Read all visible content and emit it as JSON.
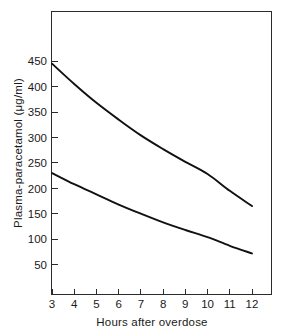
{
  "figure": {
    "background_color": "#ffffff",
    "line_color": "#111111",
    "axis_color": "#2b2b2b"
  },
  "chart_data": {
    "type": "line",
    "title": "",
    "xlabel": "Hours after overdose",
    "ylabel": "Plasma-paracetamol (μg/ml)",
    "xlim": [
      3,
      12
    ],
    "ylim": [
      0,
      470
    ],
    "grid": false,
    "legend": "none",
    "xticks": [
      3,
      4,
      5,
      6,
      7,
      8,
      9,
      10,
      11,
      12
    ],
    "xticklabels": [
      "3",
      "4",
      "5",
      "6",
      "7",
      "8",
      "9",
      "10",
      "11",
      "12"
    ],
    "yticks": [
      50,
      100,
      150,
      200,
      250,
      300,
      350,
      400,
      450
    ],
    "yticklabels": [
      "50",
      "100",
      "150",
      "200",
      "250",
      "300",
      "350",
      "400",
      "450"
    ],
    "x": [
      3,
      4,
      5,
      6,
      7,
      8,
      9,
      10,
      11,
      12
    ],
    "series": [
      {
        "name": "upper-line",
        "values": [
          445,
          405,
          368,
          335,
          304,
          277,
          252,
          228,
          195,
          165
        ]
      },
      {
        "name": "lower-line",
        "values": [
          230,
          208,
          188,
          168,
          150,
          133,
          118,
          104,
          87,
          72
        ]
      }
    ]
  },
  "axes": {
    "y_title": "Plasma-paracetamol (μg/ml)",
    "x_title": "Hours after overdose"
  }
}
